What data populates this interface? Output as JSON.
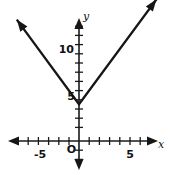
{
  "chart_data": {
    "type": "line",
    "title": "",
    "subtitle": "",
    "xlabel": "x",
    "ylabel": "y",
    "xlim": [
      -6.5,
      8.5
    ],
    "ylim": [
      -2.5,
      14.5
    ],
    "grid": false,
    "legend": null,
    "x_tick_labels": [
      "-5",
      "5"
    ],
    "x_tick_values": [
      -5,
      5
    ],
    "y_tick_labels": [
      "5",
      "10"
    ],
    "y_tick_values": [
      5,
      10
    ],
    "x_minor_tick_step": 1,
    "y_minor_tick_step": 1,
    "origin_label": "O",
    "series": [
      {
        "name": "y = 1.5|x| + 4",
        "vertex": [
          0,
          4
        ],
        "slope_left": -1.5,
        "slope_right": 1.5,
        "x": [
          -6.1,
          0,
          7.6
        ],
        "values": [
          13.2,
          4,
          15.4
        ],
        "arrow_start": true,
        "arrow_end": true
      }
    ],
    "annotations": []
  },
  "labels": {
    "x_axis_name": "x",
    "y_axis_name": "y",
    "x_neg_five": "-5",
    "x_pos_five": "5",
    "y_five": "5",
    "y_ten": "10",
    "origin": "O"
  },
  "colors": {
    "curve": "#161616",
    "axis": "#1a1a1a",
    "text": "#111111",
    "background": "#ffffff"
  }
}
